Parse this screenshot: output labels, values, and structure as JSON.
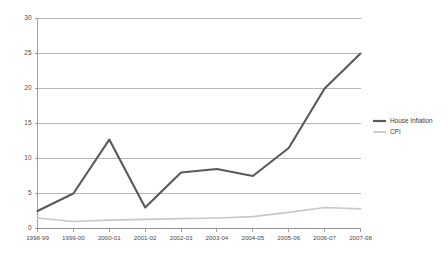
{
  "chart_data": {
    "type": "line",
    "title": "",
    "subtitle": "",
    "xlabel": "",
    "ylabel": "",
    "categories": [
      "1998-99",
      "1999-00",
      "2000-01",
      "2001-02",
      "2002-03",
      "2003-04",
      "2004-05",
      "2005-06",
      "2006-07",
      "2007-08"
    ],
    "series": [
      {
        "name": "House Inflation",
        "color": "#595959",
        "values": [
          2.5,
          5.0,
          12.7,
          3.0,
          8.0,
          8.5,
          7.5,
          11.5,
          20.0,
          25.0
        ]
      },
      {
        "name": "CPI",
        "color": "#c8c8c8",
        "values": [
          1.5,
          1.0,
          1.2,
          1.3,
          1.4,
          1.5,
          1.7,
          2.3,
          3.0,
          2.8
        ]
      }
    ],
    "ylim": [
      0,
      30
    ],
    "yticks": [
      0,
      5,
      10,
      15,
      20,
      25,
      30
    ],
    "ytick_labels": [
      "0",
      "5",
      "10",
      "15",
      "20",
      "25",
      "30"
    ],
    "grid": true,
    "grid_axis": "y",
    "legend_position": "right"
  },
  "legend": {
    "entries": [
      {
        "label": "House Inflation",
        "color": "#595959",
        "thickness": 2.2
      },
      {
        "label": "CPI",
        "color": "#c8c8c8",
        "thickness": 1.8
      }
    ]
  },
  "colors": {
    "background": "#ffffff",
    "grid": "#9a9a9a",
    "axis": "#8a8a8a",
    "tick_text": "#4a4a4a",
    "house_inflation": "#595959",
    "cpi": "#c8c8c8"
  }
}
